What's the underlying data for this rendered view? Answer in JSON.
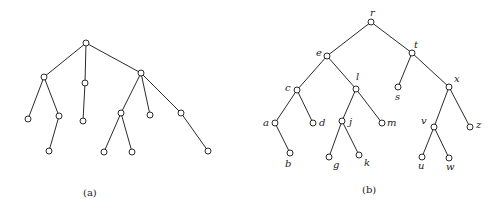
{
  "figure": {
    "trees": [
      {
        "id": "a",
        "caption": "(a)",
        "caption_pos": [
          90,
          196
        ],
        "nodes": [
          {
            "id": "a0",
            "x": 86,
            "y": 43,
            "label": ""
          },
          {
            "id": "a1",
            "x": 44,
            "y": 77,
            "label": ""
          },
          {
            "id": "a2",
            "x": 85,
            "y": 83,
            "label": ""
          },
          {
            "id": "a3",
            "x": 141,
            "y": 73,
            "label": ""
          },
          {
            "id": "a4",
            "x": 28,
            "y": 119,
            "label": ""
          },
          {
            "id": "a5",
            "x": 59,
            "y": 116,
            "label": ""
          },
          {
            "id": "a6",
            "x": 49,
            "y": 151,
            "label": ""
          },
          {
            "id": "a7",
            "x": 83,
            "y": 121,
            "label": ""
          },
          {
            "id": "a8",
            "x": 121,
            "y": 113,
            "label": ""
          },
          {
            "id": "a9",
            "x": 104,
            "y": 152,
            "label": ""
          },
          {
            "id": "a10",
            "x": 132,
            "y": 152,
            "label": ""
          },
          {
            "id": "a11",
            "x": 150,
            "y": 115,
            "label": ""
          },
          {
            "id": "a12",
            "x": 181,
            "y": 113,
            "label": ""
          },
          {
            "id": "a13",
            "x": 208,
            "y": 151,
            "label": ""
          }
        ],
        "edges": [
          [
            "a0",
            "a1"
          ],
          [
            "a0",
            "a2"
          ],
          [
            "a0",
            "a3"
          ],
          [
            "a1",
            "a4"
          ],
          [
            "a1",
            "a5"
          ],
          [
            "a5",
            "a6"
          ],
          [
            "a2",
            "a7"
          ],
          [
            "a3",
            "a8"
          ],
          [
            "a3",
            "a11"
          ],
          [
            "a3",
            "a12"
          ],
          [
            "a8",
            "a9"
          ],
          [
            "a8",
            "a10"
          ],
          [
            "a12",
            "a13"
          ]
        ]
      },
      {
        "id": "b",
        "caption": "(b)",
        "caption_pos": [
          369,
          193
        ],
        "nodes": [
          {
            "id": "r",
            "x": 371,
            "y": 22,
            "label": "r",
            "lx": 370,
            "ly": 16
          },
          {
            "id": "e",
            "x": 327,
            "y": 56,
            "label": "e",
            "lx": 316,
            "ly": 56
          },
          {
            "id": "t",
            "x": 412,
            "y": 53,
            "label": "t",
            "lx": 414,
            "ly": 48
          },
          {
            "id": "c",
            "x": 297,
            "y": 90,
            "label": "c",
            "lx": 285,
            "ly": 91
          },
          {
            "id": "l",
            "x": 356,
            "y": 89,
            "label": "l",
            "lx": 356,
            "ly": 80
          },
          {
            "id": "s",
            "x": 398,
            "y": 87,
            "label": "s",
            "lx": 395,
            "ly": 100
          },
          {
            "id": "x",
            "x": 449,
            "y": 87,
            "label": "x",
            "lx": 454,
            "ly": 82
          },
          {
            "id": "a",
            "x": 275,
            "y": 123,
            "label": "a",
            "lx": 263,
            "ly": 126
          },
          {
            "id": "d",
            "x": 313,
            "y": 123,
            "label": "d",
            "lx": 319,
            "ly": 126
          },
          {
            "id": "j",
            "x": 342,
            "y": 121,
            "label": "j",
            "lx": 349,
            "ly": 125
          },
          {
            "id": "m",
            "x": 382,
            "y": 123,
            "label": "m",
            "lx": 387,
            "ly": 126
          },
          {
            "id": "v",
            "x": 434,
            "y": 127,
            "label": "v",
            "lx": 421,
            "ly": 124
          },
          {
            "id": "z",
            "x": 470,
            "y": 127,
            "label": "z",
            "lx": 476,
            "ly": 128
          },
          {
            "id": "b",
            "x": 290,
            "y": 153,
            "label": "b",
            "lx": 285,
            "ly": 167
          },
          {
            "id": "g",
            "x": 329,
            "y": 157,
            "label": "g",
            "lx": 333,
            "ly": 168
          },
          {
            "id": "k",
            "x": 359,
            "y": 155,
            "label": "k",
            "lx": 364,
            "ly": 166
          },
          {
            "id": "u",
            "x": 422,
            "y": 157,
            "label": "u",
            "lx": 418,
            "ly": 169
          },
          {
            "id": "w",
            "x": 449,
            "y": 158,
            "label": "w",
            "lx": 446,
            "ly": 170
          }
        ],
        "edges": [
          [
            "r",
            "e"
          ],
          [
            "r",
            "t"
          ],
          [
            "e",
            "c"
          ],
          [
            "e",
            "l"
          ],
          [
            "t",
            "s"
          ],
          [
            "t",
            "x"
          ],
          [
            "c",
            "a"
          ],
          [
            "c",
            "d"
          ],
          [
            "a",
            "b"
          ],
          [
            "l",
            "j"
          ],
          [
            "l",
            "m"
          ],
          [
            "j",
            "g"
          ],
          [
            "j",
            "k"
          ],
          [
            "x",
            "v"
          ],
          [
            "x",
            "z"
          ],
          [
            "v",
            "u"
          ],
          [
            "v",
            "w"
          ]
        ]
      }
    ]
  }
}
